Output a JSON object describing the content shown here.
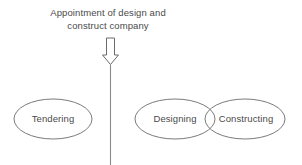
{
  "diagram": {
    "background_color": "#ffffff",
    "stroke_color": "#6b6b6b",
    "text_color": "#4a4a4a",
    "caption": {
      "line1": "Appointment of design and",
      "line2": "construct company"
    },
    "arrow": {
      "icon": "down-block-arrow-icon",
      "direction": "down"
    },
    "divider": {
      "icon": "vertical-divider-line",
      "orientation": "vertical"
    },
    "nodes": [
      {
        "id": "tendering",
        "label": "Tendering",
        "shape": "ellipse"
      },
      {
        "id": "designing",
        "label": "Designing",
        "shape": "ellipse"
      },
      {
        "id": "constructing",
        "label": "Constructing",
        "shape": "ellipse"
      }
    ]
  }
}
